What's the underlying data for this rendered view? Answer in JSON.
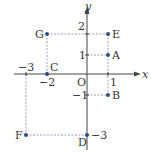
{
  "diagram": {
    "type": "coordinate-plane",
    "origin_label": "O",
    "x_axis_label": "x",
    "y_axis_label": "y",
    "colors": {
      "axis": "#444444",
      "guide": "#7a8aa0",
      "point": "#2f4f7f",
      "text": "#333333"
    },
    "ticks": {
      "x": [
        {
          "value": 1,
          "label": "1"
        },
        {
          "value": -2,
          "label": "−2"
        },
        {
          "value": -3,
          "label": "−3"
        }
      ],
      "y": [
        {
          "value": 2,
          "label": "2"
        },
        {
          "value": 1,
          "label": "1"
        },
        {
          "value": -1,
          "label": "−1"
        },
        {
          "value": -3,
          "label": "−3"
        }
      ]
    },
    "points": [
      {
        "name": "A",
        "x": 1,
        "y": 1
      },
      {
        "name": "B",
        "x": 1,
        "y": -1
      },
      {
        "name": "C",
        "x": -2,
        "y": 0
      },
      {
        "name": "D",
        "x": 0,
        "y": -3
      },
      {
        "name": "E",
        "x": 1,
        "y": 2
      },
      {
        "name": "F",
        "x": -3,
        "y": -3
      },
      {
        "name": "G",
        "x": -2,
        "y": 2
      }
    ]
  }
}
